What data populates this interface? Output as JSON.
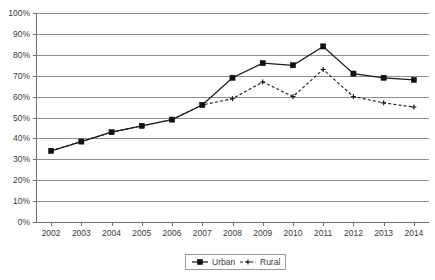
{
  "chart_data": {
    "type": "line",
    "title": "",
    "subtitle": "",
    "xlabel": "",
    "ylabel": "",
    "categories": [
      "2002",
      "2003",
      "2004",
      "2005",
      "2006",
      "2007",
      "2008",
      "2009",
      "2010",
      "2011",
      "2012",
      "2013",
      "2014"
    ],
    "series": [
      {
        "name": "Urban",
        "marker": "filled-square",
        "line_style": "solid",
        "color": "#111111",
        "values": [
          34,
          38.5,
          43,
          46,
          49,
          56,
          69,
          76,
          75,
          84,
          71,
          69,
          68
        ]
      },
      {
        "name": "Rural",
        "marker": "cross",
        "line_style": "dashed",
        "color": "#111111",
        "values": [
          34,
          38.5,
          43,
          46,
          49,
          56,
          59,
          67,
          60,
          73,
          60,
          57,
          55
        ]
      }
    ],
    "ylim": [
      0,
      100
    ],
    "ytick_values": [
      0,
      10,
      20,
      30,
      40,
      50,
      60,
      70,
      80,
      90,
      100
    ],
    "ytick_labels": [
      "0%",
      "10%",
      "20%",
      "30%",
      "40%",
      "50%",
      "60%",
      "70%",
      "80%",
      "90%",
      "100%"
    ],
    "grid": true,
    "grid_axis": "y",
    "legend_position": "bottom-center",
    "legend_entries": [
      "Urban",
      "Rural"
    ]
  },
  "legend": {
    "urban_label": "Urban",
    "rural_label": "Rural"
  },
  "colors": {
    "grid": "#8f8f8f",
    "axis": "#6e6e6e",
    "text": "#3b3b3b",
    "series": "#111111",
    "background": "#ffffff"
  }
}
